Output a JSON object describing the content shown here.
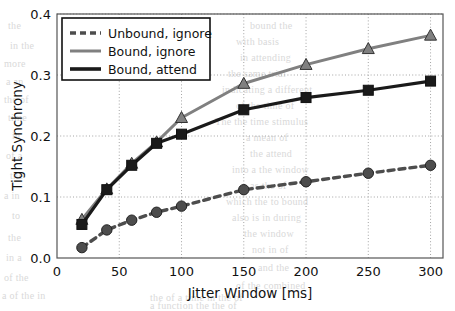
{
  "chart_data": {
    "type": "line",
    "title": "",
    "xlabel": "Jitter Window [ms]",
    "ylabel": "Tight Synchrony",
    "xlim": [
      0,
      310
    ],
    "ylim": [
      0.0,
      0.4
    ],
    "xticks": [
      "0",
      "50",
      "100",
      "150",
      "200",
      "250",
      "300"
    ],
    "xtick_values": [
      0,
      50,
      100,
      150,
      200,
      250,
      300
    ],
    "yticks": [
      "0.0",
      "0.1",
      "0.2",
      "0.3",
      "0.4"
    ],
    "ytick_values": [
      0.0,
      0.1,
      0.2,
      0.3,
      0.4
    ],
    "grid": true,
    "legend_position": "upper left",
    "x": [
      20,
      40,
      60,
      80,
      100,
      150,
      200,
      250,
      300
    ],
    "series": [
      {
        "name": "Unbound, ignore",
        "marker": "circle",
        "linestyle": "dashed",
        "color": "#4d4d4d",
        "values": [
          0.017,
          0.046,
          0.062,
          0.075,
          0.085,
          0.112,
          0.125,
          0.139,
          0.152
        ]
      },
      {
        "name": "Bound, ignore",
        "marker": "triangle",
        "linestyle": "solid",
        "color": "#808080",
        "values": [
          0.063,
          0.113,
          0.155,
          0.19,
          0.23,
          0.286,
          0.317,
          0.343,
          0.365
        ]
      },
      {
        "name": "Bound, attend",
        "marker": "square",
        "linestyle": "solid",
        "color": "#1a1a1a",
        "values": [
          0.055,
          0.112,
          0.152,
          0.188,
          0.203,
          0.243,
          0.263,
          0.275,
          0.29
        ]
      }
    ]
  },
  "legend": {
    "items": [
      {
        "label": "Unbound, ignore"
      },
      {
        "label": "Bound, ignore"
      },
      {
        "label": "Bound, attend"
      }
    ]
  },
  "background_text": [
    {
      "text": "the",
      "x": 8,
      "y": 20
    },
    {
      "text": "bound the",
      "x": 250,
      "y": 20
    },
    {
      "text": "with basis",
      "x": 236,
      "y": 36
    },
    {
      "text": "in attending",
      "x": 240,
      "y": 52
    },
    {
      "text": "the same trial",
      "x": 228,
      "y": 68
    },
    {
      "text": "indicating a different",
      "x": 222,
      "y": 84
    },
    {
      "text": "of the time of",
      "x": 236,
      "y": 100
    },
    {
      "text": "The the time stimulus",
      "x": 215,
      "y": 116
    },
    {
      "text": "a mean of",
      "x": 246,
      "y": 132
    },
    {
      "text": "the attend",
      "x": 250,
      "y": 148
    },
    {
      "text": "into a the window",
      "x": 232,
      "y": 164
    },
    {
      "text": "as the of",
      "x": 250,
      "y": 180
    },
    {
      "text": "which the to bound",
      "x": 226,
      "y": 196
    },
    {
      "text": "also is in during",
      "x": 232,
      "y": 212
    },
    {
      "text": "the window",
      "x": 244,
      "y": 228
    },
    {
      "text": "not in of",
      "x": 252,
      "y": 244
    },
    {
      "text": "and the",
      "x": 258,
      "y": 262
    },
    {
      "text": "of the combined",
      "x": 236,
      "y": 280
    },
    {
      "text": "in the",
      "x": 10,
      "y": 40
    },
    {
      "text": "more",
      "x": 4,
      "y": 58
    },
    {
      "text": "a an",
      "x": 6,
      "y": 76
    },
    {
      "text": "the of",
      "x": 4,
      "y": 94
    },
    {
      "text": "time",
      "x": 8,
      "y": 112
    },
    {
      "text": "in",
      "x": 12,
      "y": 130
    },
    {
      "text": "of a",
      "x": 6,
      "y": 150
    },
    {
      "text": "the",
      "x": 10,
      "y": 170
    },
    {
      "text": "a in",
      "x": 4,
      "y": 190
    },
    {
      "text": "to",
      "x": 12,
      "y": 210
    },
    {
      "text": "the",
      "x": 8,
      "y": 232
    },
    {
      "text": "in a",
      "x": 6,
      "y": 252
    },
    {
      "text": "of the",
      "x": 4,
      "y": 272
    },
    {
      "text": "a of the in",
      "x": 2,
      "y": 290
    },
    {
      "text": "the of a time in the of",
      "x": 150,
      "y": 292
    },
    {
      "text": "a function the the of",
      "x": 150,
      "y": 300
    }
  ]
}
